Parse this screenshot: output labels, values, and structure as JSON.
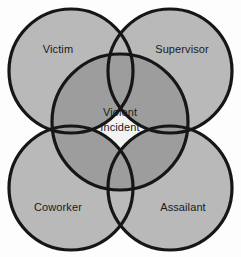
{
  "diagram": {
    "type": "venn",
    "background_color": "#fdfdfd",
    "stroke_color": "#161616",
    "circle_fill": "#b9b9b9",
    "overlap_fill": "#9d9d9d",
    "center_fill": "#f2f2f2",
    "text_color": "#1a1a1a",
    "sets": [
      {
        "id": "victim",
        "label": "Victim",
        "position": "top-left",
        "cx": 71,
        "cy": 71,
        "r": 62,
        "label_x": 58,
        "label_y": 50
      },
      {
        "id": "supervisor",
        "label": "Supervisor",
        "position": "top-right",
        "cx": 170,
        "cy": 71,
        "r": 62,
        "label_x": 182,
        "label_y": 50
      },
      {
        "id": "coworker",
        "label": "Coworker",
        "position": "bottom-left",
        "cx": 71,
        "cy": 188,
        "r": 62,
        "label_x": 58,
        "label_y": 208
      },
      {
        "id": "assailant",
        "label": "Assailant",
        "position": "bottom-right",
        "cx": 170,
        "cy": 188,
        "r": 62,
        "label_x": 183,
        "label_y": 208
      }
    ],
    "center": {
      "id": "violent-incident",
      "label_line_1": "Violent",
      "label_line_2": "Incident",
      "cx": 120,
      "cy": 122,
      "r": 68,
      "label_x": 120,
      "label_y_1": 116,
      "label_y_2": 131
    }
  }
}
